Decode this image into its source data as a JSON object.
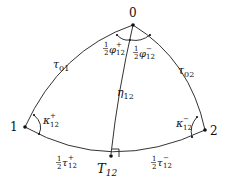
{
  "diagram": {
    "type": "spherical-triangle",
    "nodes": [
      {
        "id": "0",
        "label": "0",
        "x": 133,
        "y": 25
      },
      {
        "id": "1",
        "label": "1",
        "x": 25,
        "y": 127
      },
      {
        "id": "2",
        "label": "2",
        "x": 205,
        "y": 130
      },
      {
        "id": "T12",
        "label": "T",
        "sub": "12",
        "x": 111,
        "y": 157
      }
    ],
    "edges": [
      {
        "from": "0",
        "to": "1",
        "label": "τ",
        "sub": "01"
      },
      {
        "from": "0",
        "to": "2",
        "label": "τ",
        "sub": "02"
      },
      {
        "from": "1",
        "to": "T12",
        "label": "½τ",
        "sub": "12",
        "sup": "+"
      },
      {
        "from": "T12",
        "to": "2",
        "label": "½τ",
        "sub": "12",
        "sup": "−"
      },
      {
        "from": "0",
        "to": "T12",
        "label": "η",
        "sub": "12"
      }
    ],
    "angles": {
      "phi_plus": {
        "base": "½φ",
        "sub": "12",
        "sup": "+"
      },
      "phi_minus": {
        "base": "½φ",
        "sub": "12",
        "sup": "−"
      },
      "kappa_plus": {
        "base": "κ",
        "sub": "12",
        "sup": "+"
      },
      "kappa_minus": {
        "base": "κ",
        "sub": "12",
        "sup": "−"
      }
    },
    "labels": {
      "node0": "0",
      "node1": "1",
      "node2": "2",
      "T": "T",
      "T_sub": "12",
      "tau": "τ",
      "tau01_sub": "01",
      "tau02_sub": "02",
      "eta": "η",
      "eta_sub": "12",
      "kappa": "κ",
      "k_sub": "12",
      "plus": "+",
      "minus": "−",
      "phi": "φ",
      "half_num": "1",
      "half_den": "2"
    },
    "right_angle_marker": "T12"
  }
}
